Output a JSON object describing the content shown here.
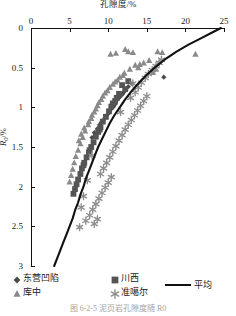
{
  "chart_data": {
    "type": "scatter",
    "title": "孔隙度/%",
    "xlabel": "孔隙度/%",
    "ylabel": "R0/%",
    "xlim": [
      0,
      25
    ],
    "ylim": [
      0,
      3
    ],
    "y_inverted": true,
    "grid": false,
    "x_ticks": [
      0,
      5,
      10,
      15,
      20,
      25
    ],
    "y_ticks": [
      0,
      0.5,
      1,
      1.5,
      2,
      2.5,
      3
    ],
    "x_tick_labels": [
      "0",
      "5",
      "10",
      "15",
      "20",
      "25"
    ],
    "y_tick_labels": [
      "0",
      "0.5",
      "1",
      "1.5",
      "2",
      "2.5",
      "3"
    ],
    "legend_position": "bottom",
    "series": [
      {
        "name": "东营凹陷",
        "marker": "diamond",
        "color": "#4a4a4a",
        "points": [
          [
            10.4,
            1.02
          ],
          [
            10.9,
            0.96
          ],
          [
            11.2,
            0.9
          ],
          [
            9.8,
            1.1
          ],
          [
            9.4,
            1.16
          ],
          [
            10.1,
            1.07
          ],
          [
            11.6,
            0.86
          ],
          [
            8.9,
            1.22
          ],
          [
            12.1,
            0.8
          ],
          [
            9.1,
            1.19
          ],
          [
            10.7,
            0.99
          ],
          [
            8.6,
            1.27
          ],
          [
            11.9,
            0.83
          ],
          [
            12.6,
            0.74
          ],
          [
            9.6,
            1.13
          ],
          [
            8.2,
            1.32
          ],
          [
            10.2,
            1.05
          ],
          [
            11.4,
            0.88
          ],
          [
            17.2,
            0.62
          ],
          [
            13.1,
            0.7
          ],
          [
            7.9,
            1.38
          ],
          [
            12.3,
            0.78
          ]
        ]
      },
      {
        "name": "川西",
        "marker": "square",
        "color": "#555555",
        "points": [
          [
            11.8,
            0.72
          ],
          [
            12.2,
            0.77
          ],
          [
            11.4,
            0.83
          ],
          [
            10.9,
            0.92
          ],
          [
            11.1,
            0.88
          ],
          [
            10.4,
            0.99
          ],
          [
            10.1,
            1.05
          ],
          [
            9.7,
            1.12
          ],
          [
            9.3,
            1.18
          ],
          [
            9.0,
            1.25
          ],
          [
            8.7,
            1.31
          ],
          [
            8.4,
            1.37
          ],
          [
            8.1,
            1.44
          ],
          [
            7.8,
            1.5
          ],
          [
            7.5,
            1.57
          ],
          [
            7.2,
            1.63
          ],
          [
            6.9,
            1.7
          ],
          [
            6.6,
            1.77
          ],
          [
            6.4,
            1.84
          ],
          [
            6.1,
            1.91
          ],
          [
            5.9,
            1.97
          ],
          [
            5.7,
            2.03
          ],
          [
            12.6,
            0.67
          ],
          [
            5.5,
            2.09
          ],
          [
            6.8,
            1.73
          ],
          [
            7.6,
            1.54
          ],
          [
            8.9,
            1.28
          ],
          [
            10.6,
            0.95
          ]
        ]
      },
      {
        "name": "库中",
        "marker": "triangle",
        "color": "#8a8a8a",
        "points": [
          [
            10.3,
            0.33
          ],
          [
            11.0,
            0.32
          ],
          [
            12.6,
            0.3
          ],
          [
            13.2,
            0.31
          ],
          [
            16.4,
            0.3
          ],
          [
            17.0,
            0.31
          ],
          [
            21.3,
            0.33
          ],
          [
            14.6,
            0.44
          ],
          [
            15.3,
            0.41
          ],
          [
            13.5,
            0.47
          ],
          [
            12.8,
            0.52
          ],
          [
            14.1,
            0.46
          ],
          [
            12.1,
            0.57
          ],
          [
            11.5,
            0.62
          ],
          [
            13.9,
            0.5
          ],
          [
            10.9,
            0.68
          ],
          [
            11.9,
            0.6
          ],
          [
            10.2,
            0.75
          ],
          [
            9.6,
            0.82
          ],
          [
            11.2,
            0.66
          ],
          [
            9.1,
            0.9
          ],
          [
            8.6,
            0.98
          ],
          [
            10.6,
            0.71
          ],
          [
            8.2,
            1.06
          ],
          [
            7.8,
            1.14
          ],
          [
            9.9,
            0.79
          ],
          [
            7.4,
            1.22
          ],
          [
            7.0,
            1.3
          ],
          [
            9.3,
            0.86
          ],
          [
            6.7,
            1.38
          ],
          [
            8.8,
            0.94
          ],
          [
            6.4,
            1.46
          ],
          [
            8.4,
            1.02
          ],
          [
            6.1,
            1.54
          ],
          [
            5.8,
            1.62
          ],
          [
            7.9,
            1.1
          ],
          [
            5.6,
            1.7
          ],
          [
            7.5,
            1.18
          ],
          [
            5.4,
            1.78
          ],
          [
            6.9,
            1.26
          ],
          [
            5.2,
            1.86
          ],
          [
            6.5,
            1.34
          ],
          [
            5.0,
            1.94
          ],
          [
            6.2,
            1.42
          ],
          [
            12.2,
            0.27
          ],
          [
            15.8,
            0.56
          ],
          [
            16.2,
            0.52
          ]
        ]
      },
      {
        "name": "准噶尔",
        "marker": "asterisk",
        "color": "#8d8d8d",
        "points": [
          [
            16.2,
            0.48
          ],
          [
            15.7,
            0.53
          ],
          [
            16.6,
            0.44
          ],
          [
            15.2,
            0.58
          ],
          [
            14.8,
            0.63
          ],
          [
            14.3,
            0.69
          ],
          [
            16.9,
            0.4
          ],
          [
            13.9,
            0.75
          ],
          [
            13.5,
            0.81
          ],
          [
            15.0,
            0.86
          ],
          [
            14.6,
            0.92
          ],
          [
            14.2,
            0.98
          ],
          [
            13.8,
            1.04
          ],
          [
            13.4,
            1.1
          ],
          [
            13.0,
            1.16
          ],
          [
            12.6,
            1.22
          ],
          [
            12.2,
            1.28
          ],
          [
            11.8,
            1.35
          ],
          [
            11.4,
            1.42
          ],
          [
            11.0,
            1.49
          ],
          [
            10.6,
            1.56
          ],
          [
            10.2,
            1.63
          ],
          [
            9.8,
            1.7
          ],
          [
            9.4,
            1.77
          ],
          [
            9.0,
            1.84
          ],
          [
            10.4,
            1.88
          ],
          [
            10.0,
            1.95
          ],
          [
            9.6,
            2.01
          ],
          [
            9.2,
            2.08
          ],
          [
            8.8,
            2.15
          ],
          [
            8.4,
            2.22
          ],
          [
            8.0,
            2.29
          ],
          [
            7.6,
            2.36
          ],
          [
            8.6,
            2.41
          ],
          [
            8.2,
            2.47
          ],
          [
            7.1,
            2.43
          ],
          [
            6.3,
            2.51
          ],
          [
            7.9,
            1.61
          ],
          [
            7.3,
            1.92
          ],
          [
            6.8,
            2.12
          ],
          [
            6.5,
            2.26
          ],
          [
            12.9,
            0.88
          ],
          [
            13.2,
            0.7
          ],
          [
            11.6,
            1.06
          ]
        ]
      }
    ],
    "average_curve": {
      "name": "平均",
      "color": "#111111",
      "points": [
        [
          24.6,
          0.0
        ],
        [
          23.4,
          0.06
        ],
        [
          22.0,
          0.13
        ],
        [
          20.4,
          0.21
        ],
        [
          18.8,
          0.3
        ],
        [
          17.3,
          0.4
        ],
        [
          16.0,
          0.5
        ],
        [
          14.9,
          0.6
        ],
        [
          13.9,
          0.7
        ],
        [
          13.0,
          0.8
        ],
        [
          12.2,
          0.9
        ],
        [
          11.5,
          1.0
        ],
        [
          10.8,
          1.1
        ],
        [
          10.2,
          1.2
        ],
        [
          9.7,
          1.3
        ],
        [
          9.2,
          1.4
        ],
        [
          8.7,
          1.5
        ],
        [
          8.3,
          1.6
        ],
        [
          7.9,
          1.7
        ],
        [
          7.5,
          1.8
        ],
        [
          7.1,
          1.9
        ],
        [
          6.8,
          2.0
        ],
        [
          6.4,
          2.1
        ],
        [
          6.1,
          2.2
        ],
        [
          5.7,
          2.3
        ],
        [
          5.4,
          2.4
        ],
        [
          5.0,
          2.5
        ],
        [
          4.6,
          2.6
        ],
        [
          4.2,
          2.7
        ],
        [
          3.8,
          2.8
        ],
        [
          3.4,
          2.9
        ],
        [
          3.0,
          3.0
        ]
      ]
    }
  },
  "legend": {
    "items": [
      {
        "label": "东营凹陷",
        "marker": "diamond",
        "color": "#4a4a4a"
      },
      {
        "label": "川西",
        "marker": "square",
        "color": "#555555"
      },
      {
        "label": "库中",
        "marker": "triangle",
        "color": "#8a8a8a"
      },
      {
        "label": "准噶尔",
        "marker": "asterisk",
        "color": "#8d8d8d"
      },
      {
        "label": "平均",
        "marker": "line",
        "color": "#111111"
      }
    ]
  },
  "caption": "图 6-2-5  泥页岩孔隙度随 R0"
}
